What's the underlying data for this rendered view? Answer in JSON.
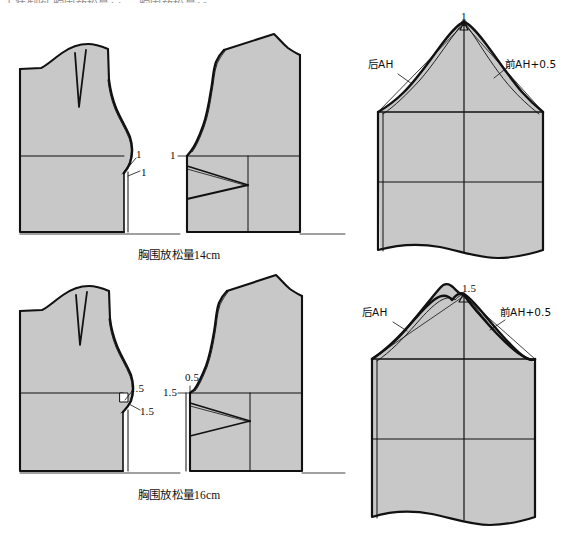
{
  "document": {
    "type": "garment-pattern-drafting-diagram",
    "truncated_header_text": "上装制图  胸围放松量14cm 胸围放松量16cm",
    "fill_color": "#c8c8c8",
    "outline_color": "#111111",
    "background": "#ffffff"
  },
  "captions": {
    "top_block": "胸围放松量14cm",
    "bottom_block": "胸围放松量16cm"
  },
  "blocks": [
    {
      "id": "block-14cm",
      "caption": "胸围放松量14cm",
      "bodice_back": {
        "name": "后片",
        "measures": [
          {
            "value": "1",
            "position": "armhole-upper"
          },
          {
            "value": "1",
            "position": "armhole-lower"
          }
        ]
      },
      "bodice_front": {
        "name": "前片",
        "measures": [
          {
            "value": "1",
            "position": "side-seam"
          }
        ]
      },
      "sleeve": {
        "name": "袖片",
        "cap_ease": "1",
        "back_label": "后AH",
        "front_label": "前AH+0.5"
      }
    },
    {
      "id": "block-16cm",
      "caption": "胸围放松量16cm",
      "bodice_back": {
        "name": "后片",
        "measures": [
          {
            "value": "1.5",
            "position": "armhole-upper"
          },
          {
            "value": "1.5",
            "position": "armhole-lower"
          }
        ]
      },
      "bodice_front": {
        "name": "前片",
        "measures": [
          {
            "value": "0.5",
            "position": "side-seam-top"
          },
          {
            "value": "1.5",
            "position": "side-seam"
          }
        ]
      },
      "sleeve": {
        "name": "袖片",
        "cap_ease": "1.5",
        "back_label": "后AH",
        "front_label": "前AH+0.5"
      }
    }
  ],
  "labels": {
    "back_ah": "后AH",
    "front_ah_plus": "前AH+0.5",
    "one": "1",
    "one_five": "1.5",
    "zero_five": "0.5"
  }
}
